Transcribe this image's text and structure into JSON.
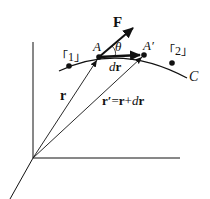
{
  "diagram": {
    "labels": {
      "force": "F",
      "point_a": "A",
      "point_a_prime": "A′",
      "theta": "θ",
      "dr_d": "d",
      "dr_r": "r",
      "point_1": "「1」",
      "point_2": "「2」",
      "curve": "C",
      "r_vector": "r",
      "r_prime_lhs": "r′",
      "r_prime_eq": "=",
      "r_prime_r": "r",
      "r_prime_plus": "+",
      "r_prime_d": "d",
      "r_prime_r2": "r"
    },
    "colors": {
      "stroke": "#111111",
      "background": "#ffffff"
    }
  }
}
